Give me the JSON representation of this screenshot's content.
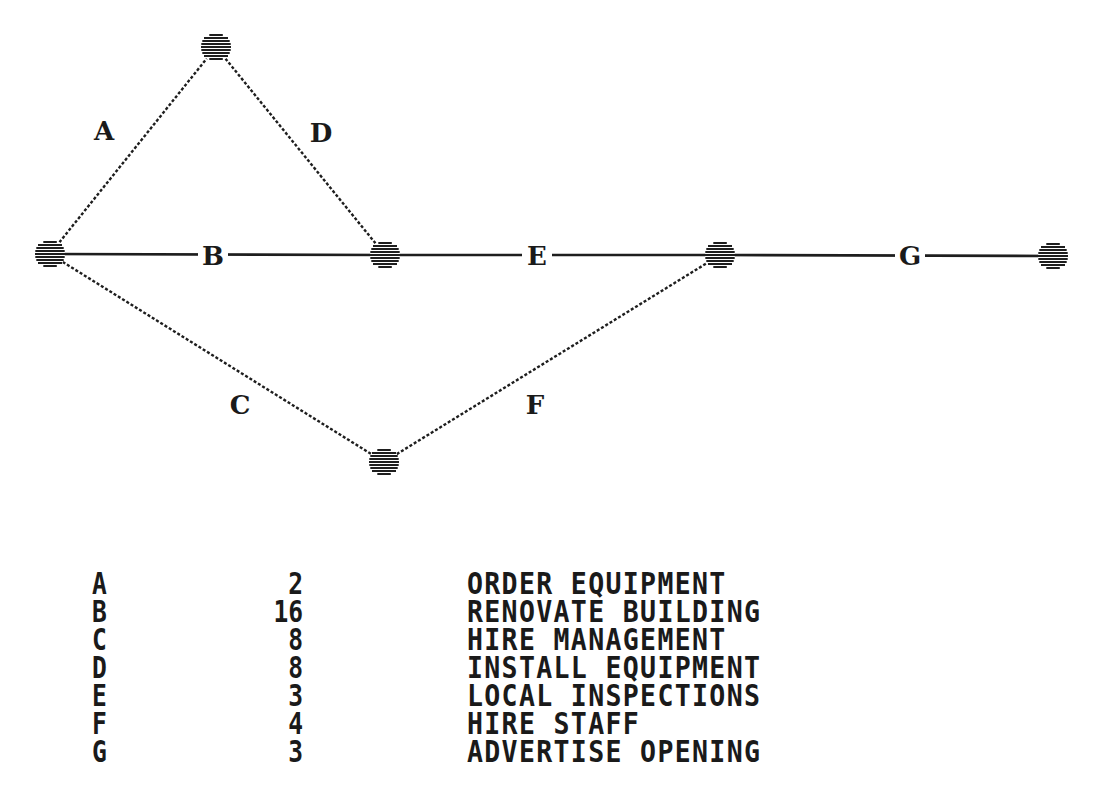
{
  "diagram": {
    "type": "activity-on-arrow network (PERT/CPM)",
    "nodes": [
      {
        "id": "n1",
        "x": 50,
        "y": 254
      },
      {
        "id": "n2",
        "x": 216,
        "y": 47
      },
      {
        "id": "n3",
        "x": 385,
        "y": 255
      },
      {
        "id": "n4",
        "x": 384,
        "y": 462
      },
      {
        "id": "n5",
        "x": 720,
        "y": 255
      },
      {
        "id": "n6",
        "x": 1053,
        "y": 256
      }
    ],
    "edges": [
      {
        "label": "A",
        "from": "n1",
        "to": "n2",
        "style": "dotted",
        "label_x": 104,
        "label_y": 131,
        "on_line": false
      },
      {
        "label": "B",
        "from": "n1",
        "to": "n3",
        "style": "solid",
        "label_x": 213,
        "label_y": 256,
        "on_line": true
      },
      {
        "label": "C",
        "from": "n1",
        "to": "n4",
        "style": "dotted",
        "label_x": 240,
        "label_y": 405,
        "on_line": false
      },
      {
        "label": "D",
        "from": "n2",
        "to": "n3",
        "style": "dotted",
        "label_x": 321,
        "label_y": 133,
        "on_line": false
      },
      {
        "label": "E",
        "from": "n3",
        "to": "n5",
        "style": "solid",
        "label_x": 537,
        "label_y": 256,
        "on_line": true
      },
      {
        "label": "F",
        "from": "n4",
        "to": "n5",
        "style": "dotted",
        "label_x": 535,
        "label_y": 405,
        "on_line": false
      },
      {
        "label": "G",
        "from": "n5",
        "to": "n6",
        "style": "solid",
        "label_x": 910,
        "label_y": 256,
        "on_line": true
      }
    ]
  },
  "activity_table": {
    "rows": [
      {
        "activity": "A",
        "duration": "2",
        "description": "ORDER EQUIPMENT"
      },
      {
        "activity": "B",
        "duration": "16",
        "description": "RENOVATE BUILDING"
      },
      {
        "activity": "C",
        "duration": "8",
        "description": "HIRE MANAGEMENT"
      },
      {
        "activity": "D",
        "duration": "8",
        "description": "INSTALL EQUIPMENT"
      },
      {
        "activity": "E",
        "duration": "3",
        "description": "LOCAL INSPECTIONS"
      },
      {
        "activity": "F",
        "duration": "4",
        "description": "HIRE STAFF"
      },
      {
        "activity": "G",
        "duration": "3",
        "description": "ADVERTISE OPENING"
      }
    ]
  },
  "colors": {
    "ink": "#1e1e1e",
    "background": "#ffffff"
  }
}
